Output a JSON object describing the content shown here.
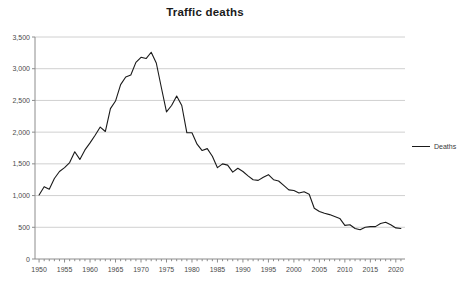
{
  "chart_data": {
    "type": "line",
    "title": "Traffic deaths",
    "xlabel": "",
    "ylabel": "",
    "xlim": [
      1949.2,
      2021.8
    ],
    "ylim": [
      0,
      3500
    ],
    "grid": true,
    "legend_position": "right",
    "legend": [
      "Deaths"
    ],
    "y_ticks": [
      0,
      500,
      1000,
      1500,
      2000,
      2500,
      3000,
      3500
    ],
    "y_tick_labels": [
      "0",
      "500",
      "1,000",
      "1,500",
      "2,000",
      "2,500",
      "3,000",
      "3,500"
    ],
    "x_tick_labels": [
      "1950",
      "1955",
      "1960",
      "1965",
      "1970",
      "1975",
      "1980",
      "1985",
      "1990",
      "1995",
      "2000",
      "2005",
      "2010",
      "2015",
      "2020"
    ],
    "x_major_ticks": [
      1950,
      1955,
      1960,
      1965,
      1970,
      1975,
      1980,
      1985,
      1990,
      1995,
      2000,
      2005,
      2010,
      2015,
      2020
    ],
    "x_minor_tick_step": 1,
    "series": [
      {
        "name": "Deaths",
        "color": "#1a1a1a",
        "x": [
          1950,
          1951,
          1952,
          1953,
          1954,
          1955,
          1956,
          1957,
          1958,
          1959,
          1960,
          1961,
          1962,
          1963,
          1964,
          1965,
          1966,
          1967,
          1968,
          1969,
          1970,
          1971,
          1972,
          1973,
          1974,
          1975,
          1976,
          1977,
          1978,
          1979,
          1980,
          1981,
          1982,
          1983,
          1984,
          1985,
          1986,
          1987,
          1988,
          1989,
          1990,
          1991,
          1992,
          1993,
          1994,
          1995,
          1996,
          1997,
          1998,
          1999,
          2000,
          2001,
          2002,
          2003,
          2004,
          2005,
          2006,
          2007,
          2008,
          2009,
          2010,
          2011,
          2012,
          2013,
          2014,
          2015,
          2016,
          2017,
          2018,
          2019,
          2020,
          2021
        ],
        "values": [
          1010,
          1140,
          1100,
          1270,
          1380,
          1440,
          1520,
          1690,
          1570,
          1720,
          1830,
          1950,
          2080,
          2010,
          2370,
          2490,
          2750,
          2870,
          2900,
          3100,
          3180,
          3160,
          3260,
          3090,
          2700,
          2320,
          2420,
          2570,
          2420,
          1990,
          1990,
          1810,
          1710,
          1740,
          1620,
          1440,
          1500,
          1480,
          1370,
          1430,
          1380,
          1310,
          1250,
          1240,
          1290,
          1330,
          1250,
          1230,
          1160,
          1090,
          1080,
          1040,
          1060,
          1020,
          800,
          750,
          720,
          700,
          670,
          640,
          530,
          540,
          480,
          460,
          500,
          510,
          510,
          560,
          580,
          540,
          490,
          480
        ]
      }
    ]
  }
}
